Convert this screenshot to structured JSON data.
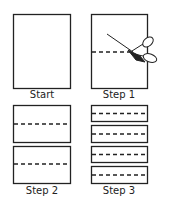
{
  "diagram": {
    "stroke_color": "#222222",
    "panels": [
      {
        "label": "Start",
        "pieces": 1,
        "cut_line": false
      },
      {
        "label": "Step 1",
        "pieces": 1,
        "cut_line": true,
        "icon": "scissors-icon"
      },
      {
        "label": "Step 2",
        "pieces": 2,
        "cut_line": true
      },
      {
        "label": "Step 3",
        "pieces": 4,
        "cut_line": true
      }
    ]
  }
}
